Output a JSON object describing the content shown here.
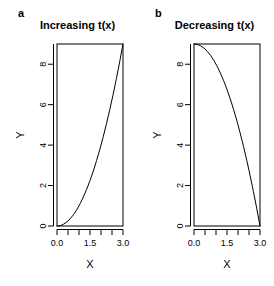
{
  "figure": {
    "width": 274,
    "height": 286,
    "background": "#ffffff",
    "line_color": "#000000"
  },
  "panels": [
    {
      "tag": "a",
      "title": "Increasing t(x)",
      "xlabel": "X",
      "ylabel": "Y"
    },
    {
      "tag": "b",
      "title": "Decreasing t(x)",
      "xlabel": "X",
      "ylabel": "Y"
    }
  ],
  "chart_data": [
    {
      "type": "line",
      "title": "Increasing t(x)",
      "panel": "a",
      "xlabel": "X",
      "ylabel": "Y",
      "xlim": [
        0.0,
        3.0
      ],
      "ylim": [
        0.0,
        9.0
      ],
      "xticks": [
        0.0,
        1.5,
        3.0
      ],
      "xticklabels": [
        "0.0",
        "1.5",
        "3.0"
      ],
      "xminorticks": [
        0.0,
        0.5,
        1.0,
        1.5,
        2.0,
        2.5,
        3.0
      ],
      "yticks": [
        0,
        2,
        4,
        6,
        8
      ],
      "yticklabels": [
        "0",
        "2",
        "4",
        "6",
        "8"
      ],
      "grid": false,
      "legend": false,
      "series": [
        {
          "name": "t(x) increasing",
          "x": [
            0.0,
            0.15,
            0.3,
            0.45,
            0.6,
            0.75,
            0.9,
            1.05,
            1.2,
            1.35,
            1.5,
            1.65,
            1.8,
            1.95,
            2.1,
            2.25,
            2.4,
            2.55,
            2.7,
            2.85,
            3.0
          ],
          "y": [
            0.0,
            0.02,
            0.09,
            0.2,
            0.36,
            0.56,
            0.81,
            1.1,
            1.44,
            1.82,
            2.25,
            2.72,
            3.24,
            3.8,
            4.41,
            5.06,
            5.76,
            6.5,
            7.29,
            8.12,
            9.0
          ]
        }
      ]
    },
    {
      "type": "line",
      "title": "Decreasing t(x)",
      "panel": "b",
      "xlabel": "X",
      "ylabel": "Y",
      "xlim": [
        0.0,
        3.0
      ],
      "ylim": [
        0.0,
        9.0
      ],
      "xticks": [
        0.0,
        1.5,
        3.0
      ],
      "xticklabels": [
        "0.0",
        "1.5",
        "3.0"
      ],
      "xminorticks": [
        0.0,
        0.5,
        1.0,
        1.5,
        2.0,
        2.5,
        3.0
      ],
      "yticks": [
        0,
        2,
        4,
        6,
        8
      ],
      "yticklabels": [
        "0",
        "2",
        "4",
        "6",
        "8"
      ],
      "grid": false,
      "legend": false,
      "series": [
        {
          "name": "t(x) decreasing",
          "x": [
            0.0,
            0.15,
            0.3,
            0.45,
            0.6,
            0.75,
            0.9,
            1.05,
            1.2,
            1.35,
            1.5,
            1.65,
            1.8,
            1.95,
            2.1,
            2.25,
            2.4,
            2.55,
            2.7,
            2.85,
            3.0
          ],
          "y": [
            9.0,
            8.98,
            8.91,
            8.8,
            8.64,
            8.44,
            8.19,
            7.9,
            7.56,
            7.18,
            6.75,
            6.28,
            5.76,
            5.2,
            4.59,
            3.94,
            3.24,
            2.5,
            1.71,
            0.88,
            0.0
          ]
        }
      ]
    }
  ]
}
